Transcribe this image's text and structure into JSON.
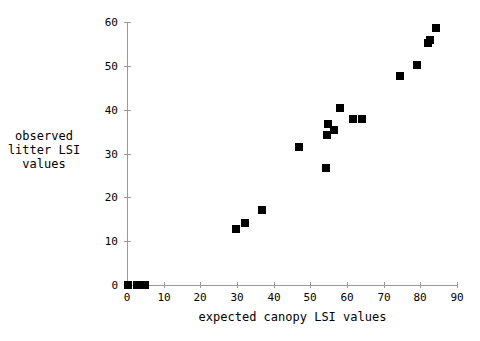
{
  "chart_data": {
    "type": "scatter",
    "title": "",
    "xlabel": "expected canopy LSI values",
    "ylabel": "observed litter LSI values",
    "ylabel_lines": [
      "observed",
      "litter LSI",
      "values"
    ],
    "xlim": [
      0,
      90
    ],
    "ylim": [
      0,
      60
    ],
    "xticks": [
      0,
      10,
      20,
      30,
      40,
      50,
      60,
      70,
      80,
      90
    ],
    "yticks": [
      0,
      10,
      20,
      30,
      40,
      50,
      60
    ],
    "xtick_labels": [
      "0",
      "10",
      "20",
      "30",
      "40",
      "50",
      "60",
      "70",
      "80",
      "90"
    ],
    "ytick_labels": [
      "0",
      "10",
      "20",
      "30",
      "40",
      "50",
      "60"
    ],
    "grid": false,
    "legend": false,
    "marker": "square",
    "marker_color": "#000000",
    "marker_size_px": 8,
    "axis_color": "#9a9a9a",
    "points": [
      {
        "x": 0.2,
        "y": 0.0
      },
      {
        "x": 2.6,
        "y": 0.0
      },
      {
        "x": 5.0,
        "y": 0.0
      },
      {
        "x": 29.8,
        "y": 12.7
      },
      {
        "x": 32.2,
        "y": 14.2
      },
      {
        "x": 36.8,
        "y": 17.0
      },
      {
        "x": 47.0,
        "y": 31.5
      },
      {
        "x": 54.4,
        "y": 26.7
      },
      {
        "x": 54.6,
        "y": 34.2
      },
      {
        "x": 54.8,
        "y": 36.8
      },
      {
        "x": 56.4,
        "y": 35.3
      },
      {
        "x": 58.0,
        "y": 40.3
      },
      {
        "x": 61.6,
        "y": 37.8
      },
      {
        "x": 64.0,
        "y": 37.8
      },
      {
        "x": 74.5,
        "y": 47.6
      },
      {
        "x": 79.0,
        "y": 50.3
      },
      {
        "x": 82.0,
        "y": 55.3
      },
      {
        "x": 82.6,
        "y": 56.0
      },
      {
        "x": 84.4,
        "y": 58.6
      }
    ]
  }
}
